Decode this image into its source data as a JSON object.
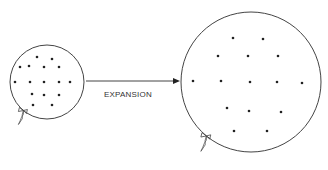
{
  "diagram": {
    "label": "EXPANSION",
    "colors": {
      "stroke": "#444444",
      "dot": "#222222",
      "background": "#ffffff"
    },
    "small_balloon": {
      "cx": 47,
      "cy": 82,
      "r": 37,
      "dots": [
        [
          37,
          57
        ],
        [
          52,
          59
        ],
        [
          20,
          67
        ],
        [
          29,
          66
        ],
        [
          44,
          67
        ],
        [
          59,
          67
        ],
        [
          15,
          82
        ],
        [
          30,
          82
        ],
        [
          44,
          82
        ],
        [
          59,
          82
        ],
        [
          70,
          82
        ],
        [
          32,
          94
        ],
        [
          44,
          95
        ],
        [
          59,
          95
        ],
        [
          33,
          105
        ],
        [
          52,
          105
        ]
      ]
    },
    "large_balloon": {
      "cx": 251,
      "cy": 82,
      "r": 70,
      "dots": [
        [
          233,
          38
        ],
        [
          263,
          39
        ],
        [
          218,
          56
        ],
        [
          248,
          56
        ],
        [
          278,
          56
        ],
        [
          193,
          81
        ],
        [
          221,
          81
        ],
        [
          250,
          82
        ],
        [
          277,
          82
        ],
        [
          302,
          83
        ],
        [
          227,
          108
        ],
        [
          249,
          111
        ],
        [
          281,
          112
        ],
        [
          234,
          131
        ],
        [
          267,
          131
        ]
      ]
    },
    "arrow": {
      "x1": 86,
      "y1": 81,
      "x2": 180,
      "y2": 81
    }
  }
}
